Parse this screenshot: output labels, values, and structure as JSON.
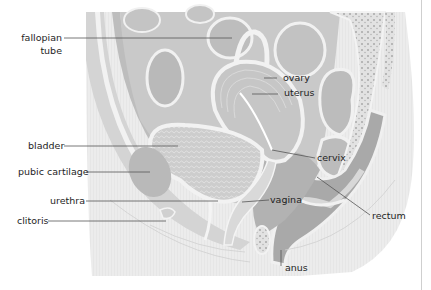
{
  "figure": {
    "colors": {
      "background": "#ffffff",
      "tissue_light": "#e6e6e6",
      "tissue_mid": "#cfcfcf",
      "tissue_dark": "#b4b4b4",
      "outline": "#f4f4f4",
      "leader_line": "#555555",
      "label_text": "#1e1e1e"
    }
  },
  "labels": {
    "fallopian_tube_1": "fallopian",
    "fallopian_tube_2": "tube",
    "ovary": "ovary",
    "uterus": "uterus",
    "bladder": "bladder",
    "pubic_cartilage": "pubic cartilage",
    "cervix": "cervix",
    "urethra": "urethra",
    "vagina": "vagina",
    "rectum": "rectum",
    "clitoris": "clitoris",
    "anus": "anus"
  }
}
